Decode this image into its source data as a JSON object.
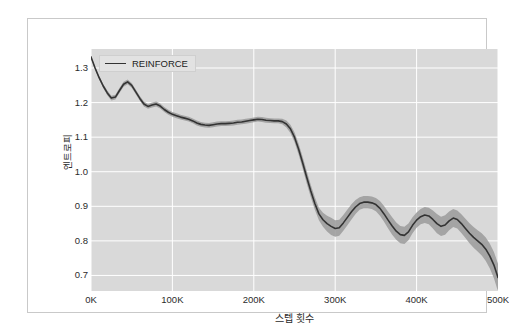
{
  "chart_data": {
    "type": "line",
    "title": "",
    "subtitle": "",
    "xlabel": "스텝 횟수",
    "ylabel": "엔트로피",
    "xlim": [
      0,
      500000
    ],
    "ylim": [
      0.655,
      1.355
    ],
    "grid": true,
    "grid_color": "#ffffff",
    "plot_background": "#d9d9d9",
    "line_color": "#333333",
    "band_color": "#9a9a9a",
    "legend_position": "upper-left",
    "legend": [
      "REINFORCE"
    ],
    "x_tick_labels": [
      "0K",
      "100K",
      "200K",
      "300K",
      "400K",
      "500K"
    ],
    "x_tick_values": [
      0,
      100000,
      200000,
      300000,
      400000,
      500000
    ],
    "y_tick_labels": [
      "0.7",
      "0.8",
      "0.9",
      "1.0",
      "1.1",
      "1.2",
      "1.3"
    ],
    "y_tick_values": [
      0.7,
      0.8,
      0.9,
      1.0,
      1.1,
      1.2,
      1.3
    ],
    "series": [
      {
        "name": "REINFORCE",
        "x": [
          0,
          5000,
          10000,
          15000,
          20000,
          25000,
          30000,
          35000,
          40000,
          45000,
          50000,
          55000,
          60000,
          65000,
          70000,
          75000,
          80000,
          85000,
          90000,
          95000,
          100000,
          105000,
          110000,
          115000,
          120000,
          125000,
          130000,
          135000,
          140000,
          145000,
          150000,
          155000,
          160000,
          165000,
          170000,
          175000,
          180000,
          185000,
          190000,
          195000,
          200000,
          205000,
          210000,
          215000,
          220000,
          225000,
          230000,
          235000,
          240000,
          245000,
          250000,
          255000,
          260000,
          265000,
          270000,
          275000,
          280000,
          285000,
          290000,
          295000,
          300000,
          305000,
          310000,
          315000,
          320000,
          325000,
          330000,
          335000,
          340000,
          345000,
          350000,
          355000,
          360000,
          365000,
          370000,
          375000,
          380000,
          385000,
          390000,
          395000,
          400000,
          405000,
          410000,
          415000,
          420000,
          425000,
          430000,
          435000,
          440000,
          445000,
          450000,
          455000,
          460000,
          465000,
          470000,
          475000,
          480000,
          485000,
          490000,
          495000,
          500000
        ],
        "values": [
          1.332,
          1.3,
          1.272,
          1.248,
          1.228,
          1.213,
          1.216,
          1.235,
          1.253,
          1.26,
          1.25,
          1.231,
          1.212,
          1.196,
          1.189,
          1.193,
          1.196,
          1.19,
          1.18,
          1.172,
          1.166,
          1.162,
          1.158,
          1.155,
          1.152,
          1.147,
          1.141,
          1.137,
          1.135,
          1.134,
          1.136,
          1.138,
          1.139,
          1.139,
          1.14,
          1.141,
          1.143,
          1.144,
          1.146,
          1.148,
          1.15,
          1.152,
          1.151,
          1.149,
          1.148,
          1.147,
          1.147,
          1.145,
          1.138,
          1.124,
          1.1,
          1.066,
          1.026,
          0.984,
          0.944,
          0.908,
          0.878,
          0.861,
          0.85,
          0.842,
          0.836,
          0.838,
          0.852,
          0.868,
          0.884,
          0.898,
          0.908,
          0.912,
          0.912,
          0.91,
          0.905,
          0.894,
          0.878,
          0.86,
          0.843,
          0.828,
          0.818,
          0.816,
          0.826,
          0.845,
          0.86,
          0.87,
          0.875,
          0.872,
          0.862,
          0.85,
          0.842,
          0.846,
          0.858,
          0.866,
          0.862,
          0.85,
          0.836,
          0.822,
          0.81,
          0.8,
          0.79,
          0.776,
          0.756,
          0.73,
          0.694
        ],
        "band_lower": [
          1.33,
          1.296,
          1.267,
          1.242,
          1.221,
          1.206,
          1.209,
          1.228,
          1.246,
          1.253,
          1.243,
          1.224,
          1.205,
          1.189,
          1.182,
          1.186,
          1.189,
          1.183,
          1.173,
          1.165,
          1.159,
          1.155,
          1.151,
          1.148,
          1.145,
          1.14,
          1.134,
          1.13,
          1.128,
          1.127,
          1.129,
          1.131,
          1.132,
          1.132,
          1.133,
          1.134,
          1.136,
          1.137,
          1.139,
          1.141,
          1.143,
          1.145,
          1.144,
          1.142,
          1.141,
          1.14,
          1.14,
          1.137,
          1.128,
          1.112,
          1.086,
          1.05,
          1.009,
          0.966,
          0.926,
          0.89,
          0.86,
          0.841,
          0.827,
          0.817,
          0.812,
          0.815,
          0.829,
          0.845,
          0.862,
          0.878,
          0.89,
          0.894,
          0.894,
          0.892,
          0.886,
          0.873,
          0.855,
          0.836,
          0.818,
          0.803,
          0.793,
          0.791,
          0.802,
          0.822,
          0.838,
          0.848,
          0.852,
          0.848,
          0.836,
          0.822,
          0.814,
          0.818,
          0.831,
          0.84,
          0.836,
          0.823,
          0.808,
          0.793,
          0.78,
          0.769,
          0.758,
          0.742,
          0.72,
          0.692,
          0.654
        ],
        "band_upper": [
          1.334,
          1.304,
          1.277,
          1.254,
          1.235,
          1.22,
          1.223,
          1.242,
          1.26,
          1.267,
          1.257,
          1.238,
          1.219,
          1.203,
          1.196,
          1.2,
          1.203,
          1.197,
          1.187,
          1.179,
          1.173,
          1.169,
          1.165,
          1.162,
          1.159,
          1.154,
          1.148,
          1.144,
          1.142,
          1.141,
          1.143,
          1.145,
          1.146,
          1.146,
          1.147,
          1.148,
          1.15,
          1.151,
          1.153,
          1.155,
          1.157,
          1.159,
          1.158,
          1.156,
          1.155,
          1.154,
          1.154,
          1.153,
          1.148,
          1.136,
          1.114,
          1.082,
          1.043,
          1.002,
          0.962,
          0.926,
          0.896,
          0.881,
          0.873,
          0.867,
          0.86,
          0.861,
          0.875,
          0.891,
          0.906,
          0.918,
          0.926,
          0.93,
          0.93,
          0.928,
          0.924,
          0.915,
          0.901,
          0.884,
          0.868,
          0.853,
          0.843,
          0.841,
          0.85,
          0.868,
          0.882,
          0.892,
          0.898,
          0.896,
          0.888,
          0.878,
          0.87,
          0.874,
          0.885,
          0.892,
          0.888,
          0.877,
          0.864,
          0.851,
          0.84,
          0.831,
          0.822,
          0.81,
          0.792,
          0.768,
          0.734
        ]
      }
    ]
  }
}
